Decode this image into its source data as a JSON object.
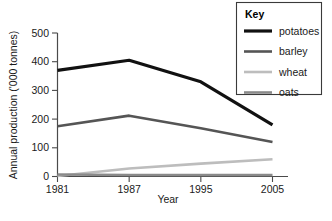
{
  "chart_data": {
    "type": "line",
    "title": "",
    "xlabel": "Year",
    "ylabel": "Annual production ('000 tonnes)",
    "categories": [
      "1981",
      "1987",
      "1995",
      "2005"
    ],
    "x": [
      1981,
      1987,
      1995,
      2005
    ],
    "xlim": [
      1981,
      2005
    ],
    "ylim": [
      0,
      500
    ],
    "yticks": [
      "0",
      "100",
      "200",
      "300",
      "400",
      "500"
    ],
    "ytick_values": [
      0,
      100,
      200,
      300,
      400,
      500
    ],
    "grid": false,
    "legend_position": "top-right",
    "legend_title": "Key",
    "series": [
      {
        "name": "potatoes",
        "values": [
          370,
          405,
          330,
          180
        ],
        "color": "#111111",
        "width": 3.2
      },
      {
        "name": "barley",
        "values": [
          175,
          212,
          168,
          120
        ],
        "color": "#555555",
        "width": 2.6
      },
      {
        "name": "wheat",
        "values": [
          2,
          28,
          45,
          60
        ],
        "color": "#bdbdbd",
        "width": 2.6
      },
      {
        "name": "oats",
        "values": [
          7,
          5,
          5,
          5
        ],
        "color": "#8a8a8a",
        "width": 2.6
      }
    ]
  },
  "colors": {
    "axis": "#4a4a4a",
    "text": "#1a1a1a",
    "background": "#ffffff",
    "legend_border": "#3a3a3a"
  }
}
